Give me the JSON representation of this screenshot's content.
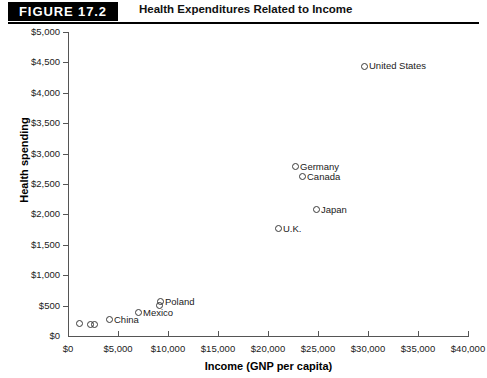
{
  "header": {
    "badge": "FIGURE 17.2",
    "title": "Health Expenditures Related to Income"
  },
  "chart_data": {
    "type": "scatter",
    "title": "Health Expenditures Related to Income",
    "xlabel": "Income (GNP per capita)",
    "ylabel": "Health spending",
    "xlim": [
      0,
      40000
    ],
    "ylim": [
      0,
      5000
    ],
    "xticks": [
      0,
      5000,
      10000,
      15000,
      20000,
      25000,
      30000,
      35000,
      40000
    ],
    "yticks": [
      0,
      500,
      1000,
      1500,
      2000,
      2500,
      3000,
      3500,
      4000,
      4500,
      5000
    ],
    "xtick_labels": [
      "$0",
      "$5,000",
      "$10,000",
      "$15,000",
      "$20,000",
      "$25,000",
      "$30,000",
      "$35,000",
      "$40,000"
    ],
    "ytick_labels": [
      "$0",
      "$500",
      "$1,000",
      "$1,500",
      "$2,000",
      "$2,500",
      "$3,000",
      "$3,500",
      "$4,000",
      "$4,500",
      "$5,000"
    ],
    "grid": false,
    "legend": "none",
    "marker": "open-circle",
    "points": [
      {
        "label": "United States",
        "x": 29600,
        "y": 4440,
        "label_side": "right"
      },
      {
        "label": "Germany",
        "x": 22700,
        "y": 2780,
        "label_side": "right"
      },
      {
        "label": "Canada",
        "x": 23400,
        "y": 2620,
        "label_side": "right"
      },
      {
        "label": "Japan",
        "x": 24800,
        "y": 2080,
        "label_side": "right"
      },
      {
        "label": "U.K.",
        "x": 21000,
        "y": 1760,
        "label_side": "right"
      },
      {
        "label": "Poland",
        "x": 9200,
        "y": 560,
        "label_side": "right"
      },
      {
        "label": "",
        "x": 9100,
        "y": 500,
        "label_side": "none"
      },
      {
        "label": "Mexico",
        "x": 7000,
        "y": 380,
        "label_side": "right"
      },
      {
        "label": "China",
        "x": 4100,
        "y": 270,
        "label_side": "right"
      },
      {
        "label": "",
        "x": 1100,
        "y": 200,
        "label_side": "none"
      },
      {
        "label": "",
        "x": 2200,
        "y": 190,
        "label_side": "none"
      },
      {
        "label": "",
        "x": 2600,
        "y": 190,
        "label_side": "none"
      }
    ]
  }
}
